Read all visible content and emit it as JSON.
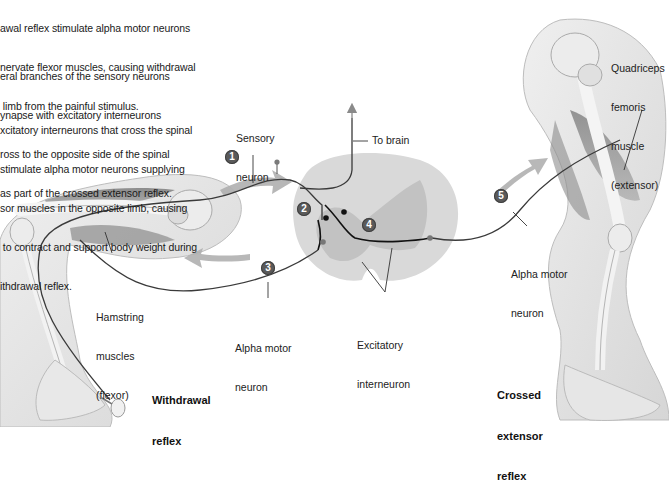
{
  "captions": {
    "step1": [
      "awal reflex stimulate alpha motor neurons",
      "nervate flexor muscles, causing withdrawal",
      " limb from the painful stimulus."
    ],
    "step2": [
      "eral branches of the sensory neurons",
      "ynapse with excitatory interneurons",
      "ross to the opposite side of the spinal",
      "as part of the crossed extensor reflex."
    ],
    "step3": [
      "xcitatory interneurons that cross the spinal",
      "stimulate alpha motor neurons supplying",
      "sor muscles in the opposite limb, causing",
      " to contract and support body weight during",
      "ithdrawal reflex."
    ]
  },
  "labels": {
    "sensory_neuron": [
      "Sensory",
      "neuron"
    ],
    "to_brain": "To brain",
    "quadriceps": [
      "Quadriceps",
      "femoris",
      "muscle",
      "(extensor)"
    ],
    "hamstring": [
      "Hamstring",
      "muscles",
      "(flexor)"
    ],
    "alpha_motor_left": [
      "Alpha motor",
      "neuron"
    ],
    "alpha_motor_right": [
      "Alpha motor",
      "neuron"
    ],
    "excitatory_interneuron": [
      "Excitatory",
      "interneuron"
    ],
    "withdrawal_reflex": [
      "Withdrawal",
      "reflex"
    ],
    "crossed_extensor_reflex": [
      "Crossed",
      "extensor",
      "reflex"
    ]
  },
  "badges": [
    "1",
    "2",
    "3",
    "4",
    "5"
  ],
  "colors": {
    "badge": "#5a5a5a",
    "arrow": "#a9a9a9",
    "nerve": "#3a3a3a",
    "spinal_white": "#d9d9d9",
    "spinal_gray": "#c2c2c2",
    "limb": "#e6e6e6",
    "muscle": "#8c8c8c"
  }
}
